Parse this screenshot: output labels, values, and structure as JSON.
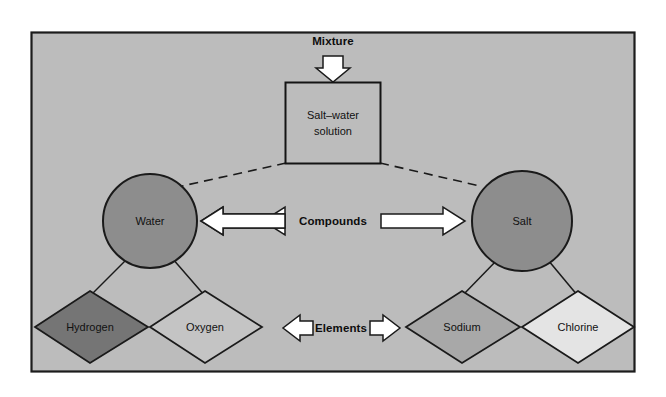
{
  "figure": {
    "panel": {
      "background_color": "#bcbcbc",
      "border_color": "#1c1c1c",
      "outside_color": "#ffffff"
    }
  },
  "levels": {
    "mixture": {
      "label": "Mixture",
      "arrow": "down-arrow"
    },
    "compounds": {
      "label": "Compounds",
      "left_arrow": "left-arrow",
      "right_arrow": "right-arrow"
    },
    "elements": {
      "label": "Elements",
      "left_arrow": "left-arrow",
      "right_arrow": "right-arrow"
    }
  },
  "mixture_box": {
    "line1": "Salt–water",
    "line2": "solution",
    "fill_color": "#bcbcbc",
    "stroke_color": "#141414"
  },
  "compounds": [
    {
      "id": "water",
      "label": "Water",
      "shape": "circle",
      "fill_color": "#8d8d8d",
      "stroke_color": "#1a1a1a"
    },
    {
      "id": "salt",
      "label": "Salt",
      "shape": "circle",
      "fill_color": "#8d8d8d",
      "stroke_color": "#1a1a1a"
    }
  ],
  "elements": [
    {
      "id": "hydrogen",
      "label": "Hydrogen",
      "shape": "diamond",
      "fill_color": "#757575",
      "stroke_color": "#1a1a1a",
      "parent": "water"
    },
    {
      "id": "oxygen",
      "label": "Oxygen",
      "shape": "diamond",
      "fill_color": "#c4c4c4",
      "stroke_color": "#1a1a1a",
      "parent": "water"
    },
    {
      "id": "sodium",
      "label": "Sodium",
      "shape": "diamond",
      "fill_color": "#a8a8a8",
      "stroke_color": "#1a1a1a",
      "parent": "salt"
    },
    {
      "id": "chlorine",
      "label": "Chlorine",
      "shape": "diamond",
      "fill_color": "#e4e4e4",
      "stroke_color": "#1a1a1a",
      "parent": "salt"
    }
  ],
  "connectors": {
    "mixture_to_water": "dashed",
    "mixture_to_salt": "dashed",
    "water_to_hydrogen": "solid",
    "water_to_oxygen": "solid",
    "salt_to_sodium": "solid",
    "salt_to_chlorine": "solid"
  }
}
